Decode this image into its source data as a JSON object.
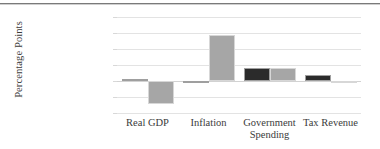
{
  "figure": {
    "clipped_title_fragment": "",
    "y_axis_title": "Percentage Points"
  },
  "chart_data": {
    "type": "bar",
    "title": "",
    "subtitle": "",
    "xlabel": "",
    "ylabel": "Percentage Points",
    "ylim": [
      -10,
      20
    ],
    "yticks": [
      20,
      15,
      10,
      5,
      0,
      -5,
      -10
    ],
    "ytick_labels": [
      "20",
      "15",
      "10",
      "5",
      "0",
      "-5",
      "-10"
    ],
    "grid": true,
    "legend": "none",
    "legend_entries": [],
    "categories": [
      "Real GDP",
      "Inflation",
      "Government Spending",
      "Tax Revenue"
    ],
    "category_label_lines": [
      [
        "Real GDP"
      ],
      [
        "Inflation"
      ],
      [
        "Government",
        "Spending"
      ],
      [
        "Tax Revenue"
      ]
    ],
    "series": [
      {
        "name": "series-1",
        "color": "#2b2b2b",
        "values": [
          0.5,
          -0.4,
          4.0,
          2.0
        ]
      },
      {
        "name": "series-2",
        "color": "#a6a6a6",
        "values": [
          -7.1,
          14.4,
          4.2,
          -0.3
        ]
      }
    ]
  },
  "colors": {
    "series_dark": "#2b2b2b",
    "series_light": "#a6a6a6",
    "gridline": "#e3e3e3",
    "zero_line": "#d2d2d2",
    "text": "#3b3b3b",
    "rule": "#7a7a7a"
  }
}
